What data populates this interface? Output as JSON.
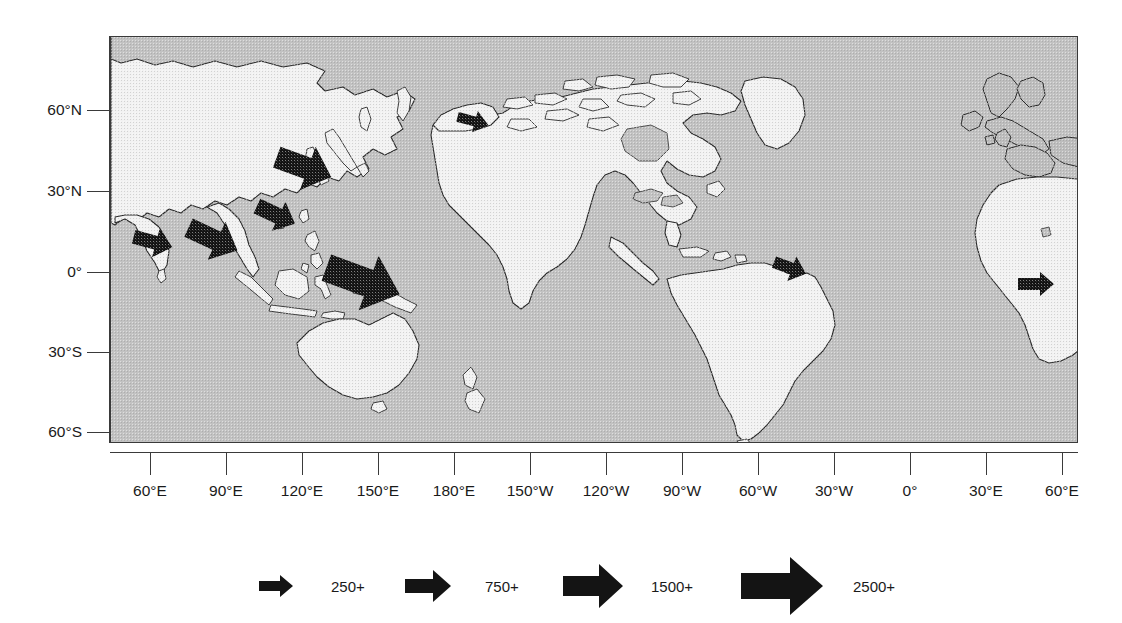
{
  "figure": {
    "type": "thematic-flow-map",
    "projection": "equirectangular",
    "title": "",
    "background_color": "#ffffff",
    "ocean_color": "#c2c2c2",
    "land_color": "#f2f2f2",
    "coastline_color": "#2a2a2a",
    "arrow_color": "#141414"
  },
  "axes": {
    "x_label": "",
    "y_label": "",
    "x_ticks": [
      {
        "label": "60°E",
        "lon": 60,
        "px": 150
      },
      {
        "label": "90°E",
        "lon": 90,
        "px": 226
      },
      {
        "label": "120°E",
        "lon": 120,
        "px": 302
      },
      {
        "label": "150°E",
        "lon": 150,
        "px": 378
      },
      {
        "label": "180°E",
        "lon": 180,
        "px": 454
      },
      {
        "label": "150°W",
        "lon": -150,
        "px": 530
      },
      {
        "label": "120°W",
        "lon": -120,
        "px": 606
      },
      {
        "label": "90°W",
        "lon": -90,
        "px": 682
      },
      {
        "label": "60°W",
        "lon": -60,
        "px": 758
      },
      {
        "label": "30°W",
        "lon": -30,
        "px": 834
      },
      {
        "label": "0°",
        "lon": 0,
        "px": 910
      },
      {
        "label": "30°E",
        "lon": 30,
        "px": 986
      },
      {
        "label": "60°E",
        "lon": 60,
        "px": 1062
      }
    ],
    "y_ticks": [
      {
        "label": "60°N",
        "lat": 60,
        "px": 110
      },
      {
        "label": "30°N",
        "lat": 30,
        "px": 191
      },
      {
        "label": "0°",
        "lat": 0,
        "px": 272
      },
      {
        "label": "30°S",
        "lat": -30,
        "px": 352
      },
      {
        "label": "60°S",
        "lat": -60,
        "px": 432
      }
    ]
  },
  "legend": {
    "title": "",
    "items": [
      {
        "label": "250+",
        "value": 250,
        "arrow_length": 34,
        "arrow_height": 22
      },
      {
        "label": "750+",
        "value": 750,
        "arrow_length": 46,
        "arrow_height": 32
      },
      {
        "label": "1500+",
        "value": 1500,
        "arrow_length": 60,
        "arrow_height": 44
      },
      {
        "label": "2500+",
        "value": 2500,
        "arrow_length": 82,
        "arrow_height": 58
      }
    ]
  },
  "flow_arrows": [
    {
      "name": "northeast-asia-flow",
      "origin": "Japan / Korea",
      "magnitude_class": "1500+",
      "value": 1500,
      "cx": 193,
      "cy": 130,
      "length": 58,
      "height": 46,
      "rotation": 200
    },
    {
      "name": "southeast-china-flow",
      "origin": "South China",
      "magnitude_class": "750+",
      "value": 750,
      "cx": 165,
      "cy": 178,
      "length": 42,
      "height": 32,
      "rotation": 205
    },
    {
      "name": "indochina-flow",
      "origin": "Indochina",
      "magnitude_class": "1500+",
      "value": 1500,
      "cx": 102,
      "cy": 202,
      "length": 54,
      "height": 42,
      "rotation": 205
    },
    {
      "name": "south-asia-flow",
      "origin": "India / South Asia",
      "magnitude_class": "750+",
      "value": 750,
      "cx": 42,
      "cy": 205,
      "length": 40,
      "height": 30,
      "rotation": 195
    },
    {
      "name": "western-pacific-flow",
      "origin": "Western Pacific",
      "magnitude_class": "2500+",
      "value": 2500,
      "cx": 252,
      "cy": 244,
      "length": 78,
      "height": 58,
      "rotation": 200
    },
    {
      "name": "bering-alaska-flow",
      "origin": "Bering / Alaska",
      "magnitude_class": "250+",
      "value": 250,
      "cx": 362,
      "cy": 84,
      "length": 32,
      "height": 22,
      "rotation": 195
    },
    {
      "name": "northeast-brazil-flow",
      "origin": "Northeast Brazil",
      "magnitude_class": "250+",
      "value": 250,
      "cx": 679,
      "cy": 231,
      "length": 34,
      "height": 26,
      "rotation": 200
    },
    {
      "name": "east-africa-flow",
      "origin": "East Africa",
      "magnitude_class": "250+",
      "value": 250,
      "cx": 925,
      "cy": 247,
      "length": 36,
      "height": 24,
      "rotation": 0
    }
  ]
}
